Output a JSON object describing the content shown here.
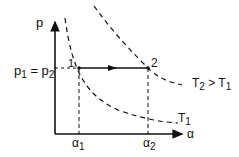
{
  "diagram": {
    "y_axis_label": "p",
    "x_axis_label": "α",
    "pressure_label_main": "p",
    "pressure_label_sub1": "1",
    "pressure_label_eq": " = p",
    "pressure_label_sub2": "2",
    "point1_label": "1",
    "point2_label": "2",
    "alpha1_main": "α",
    "alpha1_sub": "1",
    "alpha2_main": "α",
    "alpha2_sub": "2",
    "curve_T2_label": "T",
    "curve_T2_sub": "2",
    "curve_T2_rel": " > T",
    "curve_T2_rel_sub": "1",
    "curve_T1_label": "T",
    "curve_T1_sub": "1"
  }
}
